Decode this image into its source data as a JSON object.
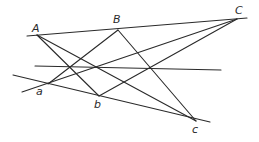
{
  "diagram": {
    "type": "projective-geometry-figure",
    "points": {
      "A": {
        "label": "A",
        "x": 37,
        "y": 35
      },
      "B": {
        "label": "B",
        "x": 118,
        "y": 30
      },
      "C": {
        "label": "C",
        "x": 237,
        "y": 19
      },
      "a": {
        "label": "a",
        "x": 48,
        "y": 84
      },
      "b": {
        "label": "b",
        "x": 99,
        "y": 96
      },
      "c": {
        "label": "c",
        "x": 196,
        "y": 121
      }
    },
    "labels": [
      {
        "id": "A",
        "text": "A",
        "x": 32,
        "y": 32
      },
      {
        "id": "B",
        "text": "B",
        "x": 113,
        "y": 23
      },
      {
        "id": "C",
        "text": "C",
        "x": 235,
        "y": 14
      },
      {
        "id": "a",
        "text": "a",
        "x": 36,
        "y": 95
      },
      {
        "id": "b",
        "text": "b",
        "x": 94,
        "y": 108
      },
      {
        "id": "c",
        "text": "c",
        "x": 192,
        "y": 133
      }
    ],
    "lines": [
      {
        "name": "line-ABC",
        "x1": 27,
        "y1": 36,
        "x2": 247,
        "y2": 18
      },
      {
        "name": "line-abc",
        "x1": 13,
        "y1": 75,
        "x2": 210,
        "y2": 122
      },
      {
        "name": "line-axis-horizontal",
        "x1": 35,
        "y1": 66,
        "x2": 221,
        "y2": 70
      },
      {
        "name": "line-A-b",
        "x1": 37,
        "y1": 35,
        "x2": 99,
        "y2": 96
      },
      {
        "name": "line-A-c",
        "x1": 37,
        "y1": 35,
        "x2": 196,
        "y2": 121
      },
      {
        "name": "line-B-a",
        "x1": 118,
        "y1": 30,
        "x2": 48,
        "y2": 84
      },
      {
        "name": "line-B-c",
        "x1": 118,
        "y1": 30,
        "x2": 196,
        "y2": 121
      },
      {
        "name": "line-C-a",
        "x1": 237,
        "y1": 19,
        "x2": 22,
        "y2": 92
      },
      {
        "name": "line-C-b",
        "x1": 237,
        "y1": 19,
        "x2": 99,
        "y2": 96
      }
    ]
  }
}
